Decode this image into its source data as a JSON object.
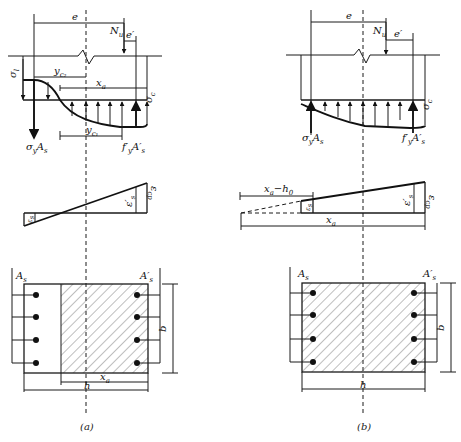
{
  "figure": {
    "panels": [
      {
        "id": "a",
        "caption": "(a)",
        "labels": {
          "e": "e",
          "Nu": "N",
          "Nu_sub": "u",
          "e_prime": "e′",
          "sigma_l": "σ",
          "sigma_l_sub": "l",
          "sigma_c": "σ",
          "sigma_c_sub": "c",
          "yc2": "y",
          "yc2_sub": "c₂",
          "yc1": "y",
          "yc1_sub": "c₁",
          "xa": "x",
          "xa_sub": "a",
          "sigma_y_As": "σ",
          "sigma_y_As_sub": "y",
          "sigma_y_As_tail": "A",
          "sigma_y_As_tail_sub": "s",
          "fy_As": "f′",
          "fy_As_sub": "y",
          "fy_As_tail": "A′",
          "fy_As_tail_sub": "s",
          "eps_s": "ε",
          "eps_s_sub": "s",
          "eps_s_prime": "ε′",
          "eps_s_prime_sub": "s",
          "eps_cp": "ε",
          "eps_cp_sub": "cp",
          "As": "A",
          "As_sub": "s",
          "As_prime": "A′",
          "As_prime_sub": "s",
          "b": "b",
          "h": "h",
          "xa_bottom": "x",
          "xa_bottom_sub": "a"
        }
      },
      {
        "id": "b",
        "caption": "(b)",
        "labels": {
          "e": "e",
          "Nu": "N",
          "Nu_sub": "u",
          "e_prime": "e′",
          "sigma_c": "σ",
          "sigma_c_sub": "c",
          "sigma_y_As": "σ",
          "sigma_y_As_sub": "y",
          "sigma_y_As_tail": "A",
          "sigma_y_As_tail_sub": "s",
          "fy_As": "f′",
          "fy_As_sub": "y",
          "fy_As_tail": "A′",
          "fy_As_tail_sub": "s",
          "xa_h0": "x",
          "xa_h0_sub": "a",
          "xa_h0_tail": "−h",
          "xa_h0_tail_sub": "0",
          "xa": "x",
          "xa_sub": "a",
          "eps_s": "ε",
          "eps_s_sub": "s",
          "eps_s_prime": "ε′",
          "eps_s_prime_sub": "s",
          "eps_cp": "ε",
          "eps_cp_sub": "cp",
          "As": "A",
          "As_sub": "s",
          "As_prime": "A′",
          "As_prime_sub": "s",
          "b": "b",
          "h": "h"
        }
      }
    ],
    "rebar_count_per_side": 4
  }
}
